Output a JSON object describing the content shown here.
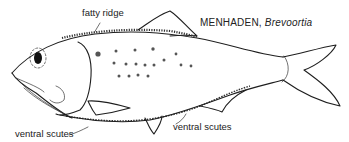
{
  "title": {
    "common_name": "MENHADEN,",
    "genus": "Brevoortia"
  },
  "labels": {
    "fatty_ridge": "fatty ridge",
    "ventral_scutes_left": "ventral scutes",
    "ventral_scutes_right": "ventral scutes"
  },
  "colors": {
    "ink": "#1e1e1e",
    "background": "#ffffff"
  }
}
